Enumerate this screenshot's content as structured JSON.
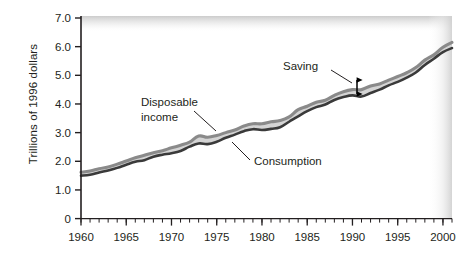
{
  "chart_data": {
    "type": "area",
    "title": "",
    "subtitle": "",
    "xlabel": "",
    "ylabel": "Trillions of 1996 dollars",
    "xlim": [
      1960,
      2001
    ],
    "ylim": [
      0,
      7.0
    ],
    "grid": false,
    "legend_position": "inline-annotations",
    "x_tick_labels": [
      "1960",
      "1965",
      "1970",
      "1975",
      "1980",
      "1985",
      "1990",
      "1995",
      "2000"
    ],
    "x_tick_values": [
      1960,
      1965,
      1970,
      1975,
      1980,
      1985,
      1990,
      1995,
      2000
    ],
    "x_minor_tick_step": 1,
    "y_tick_labels": [
      "0",
      "1.0",
      "2.0",
      "3.0",
      "4.0",
      "5.0",
      "6.0",
      "7.0"
    ],
    "y_tick_values": [
      0,
      1.0,
      2.0,
      3.0,
      4.0,
      5.0,
      6.0,
      7.0
    ],
    "x": [
      1960,
      1961,
      1962,
      1963,
      1964,
      1965,
      1966,
      1967,
      1968,
      1969,
      1970,
      1971,
      1972,
      1973,
      1974,
      1975,
      1976,
      1977,
      1978,
      1979,
      1980,
      1981,
      1982,
      1983,
      1984,
      1985,
      1986,
      1987,
      1988,
      1989,
      1990,
      1991,
      1992,
      1993,
      1994,
      1995,
      1996,
      1997,
      1998,
      1999,
      2000,
      2001
    ],
    "series": [
      {
        "name": "Disposable income",
        "color": "#8a8a8a",
        "values": [
          1.62,
          1.66,
          1.74,
          1.8,
          1.9,
          2.01,
          2.12,
          2.21,
          2.3,
          2.37,
          2.47,
          2.56,
          2.67,
          2.88,
          2.84,
          2.9,
          3.0,
          3.09,
          3.23,
          3.31,
          3.31,
          3.38,
          3.42,
          3.55,
          3.8,
          3.92,
          4.06,
          4.13,
          4.3,
          4.43,
          4.5,
          4.5,
          4.63,
          4.7,
          4.83,
          4.96,
          5.09,
          5.27,
          5.53,
          5.72,
          5.98,
          6.15
        ]
      },
      {
        "name": "Consumption",
        "color": "#3a3a3a",
        "values": [
          1.5,
          1.53,
          1.61,
          1.68,
          1.77,
          1.88,
          1.98,
          2.04,
          2.16,
          2.23,
          2.28,
          2.36,
          2.51,
          2.62,
          2.6,
          2.68,
          2.82,
          2.93,
          3.05,
          3.12,
          3.09,
          3.13,
          3.19,
          3.38,
          3.57,
          3.75,
          3.89,
          3.98,
          4.14,
          4.24,
          4.3,
          4.26,
          4.38,
          4.5,
          4.65,
          4.77,
          4.92,
          5.1,
          5.36,
          5.58,
          5.81,
          5.95
        ]
      }
    ],
    "band": {
      "name": "Saving",
      "description": "Shaded area between Disposable income and Consumption",
      "fill_color": "#d4d4d4"
    },
    "annotations": [
      {
        "label": "Disposable income",
        "target_year": 1973,
        "leader": true
      },
      {
        "label": "Consumption",
        "target_year": 1981,
        "leader": true
      },
      {
        "label": "Saving",
        "target_year": 1989,
        "leader": true,
        "marker": "double-headed-arrow"
      }
    ]
  },
  "axis": {
    "y_title": "Trillions of 1996 dollars"
  },
  "annotation_labels": {
    "disposable_line1": "Disposable",
    "disposable_line2": "income",
    "consumption": "Consumption",
    "saving": "Saving"
  }
}
